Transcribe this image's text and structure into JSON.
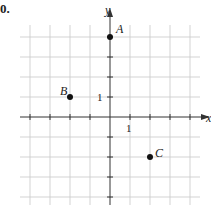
{
  "problem_number": "0.",
  "axes": {
    "x_label": "x",
    "y_label": "y",
    "x_tick_label": "1",
    "y_tick_label": "1",
    "x_range": [
      -4,
      4
    ],
    "y_range": [
      -4,
      4
    ],
    "grid": true
  },
  "points": [
    {
      "name": "A",
      "x": 0,
      "y": 4
    },
    {
      "name": "B",
      "x": -2,
      "y": 1
    },
    {
      "name": "C",
      "x": 2,
      "y": -2
    }
  ],
  "colors": {
    "grid": "#c8c8c8",
    "axis": "#333333",
    "point": "#111111"
  }
}
